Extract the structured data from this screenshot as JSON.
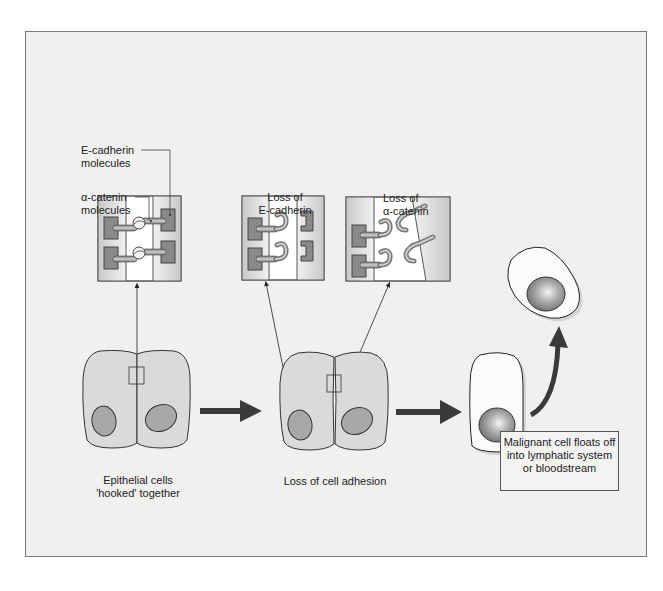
{
  "labels": {
    "e_cadherin": "E-cadherin",
    "e_cadherin_2": "molecules",
    "a_catenin": "α-catenin",
    "a_catenin_2": "molecules",
    "loss_ecad_1": "Loss of",
    "loss_ecad_2": "E-cadherin",
    "loss_acat_1": "Loss of",
    "loss_acat_2": "α-catenin",
    "stage1_1": "Epithelial cells",
    "stage1_2": "'hooked' together",
    "stage2": "Loss of cell adhesion",
    "callout_1": "Malignant cell floats off",
    "callout_2": "into lymphatic system",
    "callout_3": "or bloodstream"
  },
  "colors": {
    "background": "#f0f0ef",
    "cell_fill": "#dcdcdc",
    "nucleus": "#a8a8a8",
    "block": "#8a8a8a",
    "arrow": "#3a3a3a",
    "outline": "#333333"
  },
  "stages": [
    {
      "id": "normal",
      "caption": "Epithelial cells 'hooked' together"
    },
    {
      "id": "loss_adhesion",
      "caption": "Loss of cell adhesion"
    },
    {
      "id": "malignant",
      "caption": "Malignant cell floats off into lymphatic system or bloodstream"
    }
  ]
}
